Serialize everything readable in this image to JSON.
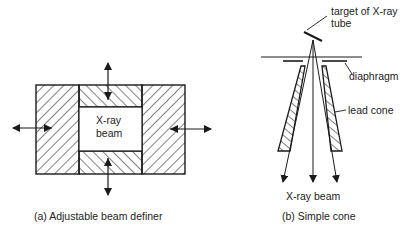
{
  "panel_a": {
    "caption": "(a)  Adjustable beam definer",
    "center_label_line1": "X-ray",
    "center_label_line2": "beam"
  },
  "panel_b": {
    "caption": "(b)  Simple cone",
    "target_label_line1": "target of X-ray",
    "target_label_line2": "tube",
    "diaphragm_label": "diaphragm",
    "lead_cone_label": "lead cone",
    "beam_label": "X-ray beam"
  },
  "colors": {
    "line": "#1a1a1a",
    "background": "#ffffff"
  }
}
